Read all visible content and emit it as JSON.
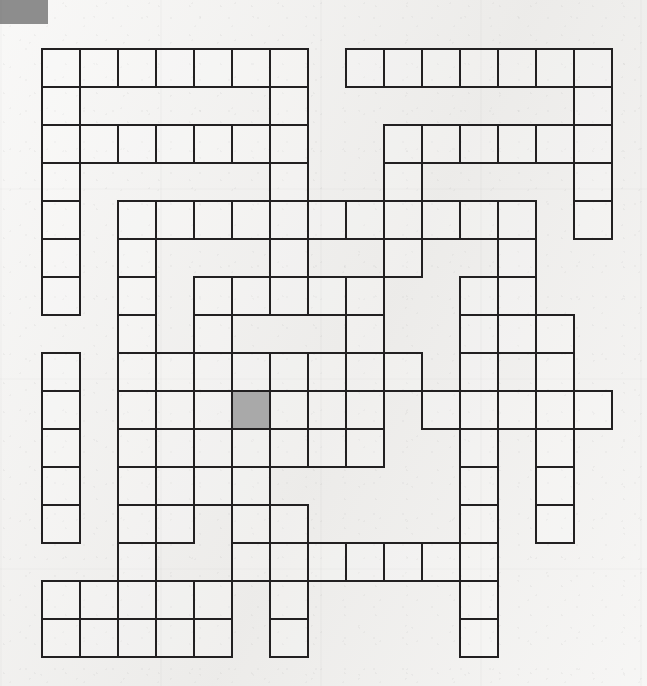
{
  "page": {
    "kind": "crossword-puzzle-grid",
    "width": 647,
    "height": 686,
    "background_color": "#f1f0ee"
  },
  "corner_block": {
    "name": "page-corner-marker",
    "color": "#8d8d8d",
    "x": 0,
    "y": 0,
    "width": 48,
    "height": 24
  },
  "grid": {
    "origin_x": 41,
    "origin_y": 48,
    "cell_size": 38,
    "columns": 15,
    "rows": 16,
    "line_color": "#222021",
    "line_width": 2,
    "cell_fill": "rgba(255,255,255,0.22)",
    "shaded_fill": "#a9a9a9",
    "shaded_cells": [
      [
        9,
        5
      ]
    ],
    "filled_rows": [
      [
        0,
        1,
        2,
        3,
        4,
        5,
        6,
        8,
        9,
        10,
        11,
        12,
        13,
        14
      ],
      [
        0,
        6,
        14
      ],
      [
        0,
        1,
        2,
        3,
        4,
        5,
        6,
        9,
        10,
        11,
        12,
        13,
        14
      ],
      [
        0,
        6,
        9,
        14
      ],
      [
        0,
        2,
        3,
        4,
        5,
        6,
        7,
        8,
        9,
        10,
        11,
        12,
        14
      ],
      [
        0,
        2,
        6,
        9,
        12
      ],
      [
        0,
        2,
        4,
        5,
        6,
        7,
        8,
        11,
        12
      ],
      [
        2,
        4,
        8,
        11,
        12,
        13
      ],
      [
        0,
        2,
        3,
        4,
        5,
        6,
        7,
        8,
        9,
        11,
        13
      ],
      [
        0,
        2,
        3,
        4,
        5,
        6,
        7,
        8,
        10,
        11,
        12,
        13,
        14
      ],
      [
        0,
        2,
        3,
        4,
        5,
        6,
        7,
        8,
        11,
        13
      ],
      [
        0,
        2,
        3,
        4,
        5,
        11,
        13
      ],
      [
        0,
        2,
        3,
        5,
        6,
        11,
        13
      ],
      [
        2,
        5,
        6,
        7,
        8,
        9,
        10,
        11
      ],
      [
        0,
        1,
        2,
        3,
        4,
        6,
        11
      ],
      [
        0,
        1,
        2,
        3,
        4,
        6,
        11
      ]
    ]
  }
}
